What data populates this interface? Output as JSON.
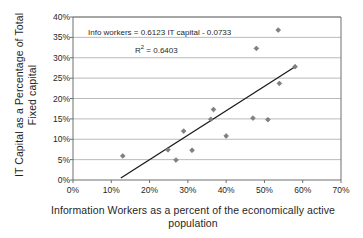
{
  "chart_data": {
    "type": "scatter",
    "title": "",
    "xlabel": "Information Workers as a percent of the economically active\npopulation",
    "ylabel": "IT Capital as a Percentage of Total\nFixed capital",
    "xlim": [
      0,
      70
    ],
    "ylim": [
      0,
      40
    ],
    "xtick_labels": [
      "0%",
      "10%",
      "20%",
      "30%",
      "40%",
      "50%",
      "60%",
      "70%"
    ],
    "xtick_values": [
      0,
      10,
      20,
      30,
      40,
      50,
      60,
      70
    ],
    "ytick_labels": [
      "0%",
      "5%",
      "10%",
      "15%",
      "20%",
      "25%",
      "30%",
      "35%",
      "40%"
    ],
    "ytick_values": [
      0,
      5,
      10,
      15,
      20,
      25,
      30,
      35,
      40
    ],
    "grid": "horizontal",
    "legend": "none",
    "marker": "diamond",
    "marker_color": "#808080",
    "points": [
      {
        "x": 13.0,
        "y": 5.9
      },
      {
        "x": 24.8,
        "y": 7.4
      },
      {
        "x": 26.9,
        "y": 4.9
      },
      {
        "x": 28.9,
        "y": 12.0
      },
      {
        "x": 31.1,
        "y": 7.3
      },
      {
        "x": 36.0,
        "y": 14.9
      },
      {
        "x": 36.7,
        "y": 17.3
      },
      {
        "x": 40.0,
        "y": 10.8
      },
      {
        "x": 47.0,
        "y": 15.2
      },
      {
        "x": 47.9,
        "y": 32.3
      },
      {
        "x": 50.9,
        "y": 14.8
      },
      {
        "x": 53.6,
        "y": 36.8
      },
      {
        "x": 53.9,
        "y": 23.7
      },
      {
        "x": 58.0,
        "y": 27.8
      }
    ],
    "trendline": {
      "slope": 0.6123,
      "intercept": -0.0733,
      "x_start": 12.5,
      "y_start": 0.5,
      "x_end": 58.0,
      "y_end": 27.8,
      "color": "#1a1a1a"
    },
    "annotations": {
      "equation": "Info workers = 0.6123 IT capital - 0.0733",
      "r_squared_label": "R",
      "r_squared_exponent": "2",
      "r_squared_value": " = 0.6403"
    }
  }
}
